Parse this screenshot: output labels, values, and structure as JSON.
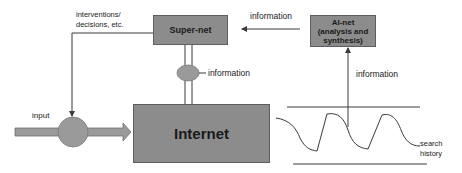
{
  "diagram": {
    "nodes": {
      "super_net": {
        "label": "Super-net"
      },
      "ai_net": {
        "line1": "AI-net",
        "line2": "(analysis and",
        "line3": "synthesis)"
      },
      "internet": {
        "label": "Internet"
      }
    },
    "edge_labels": {
      "interventions_line1": "interventions/",
      "interventions_line2": "decisions, etc.",
      "info_top": "information",
      "info_middle": "information",
      "info_right": "information",
      "input": "input",
      "search_line1": "search",
      "search_line2": "history"
    },
    "colors": {
      "box_fill": "#8c8c8c",
      "box_border": "#5e5e5e",
      "node_fill": "#9a9a9a",
      "line": "#3a3a3a"
    }
  }
}
